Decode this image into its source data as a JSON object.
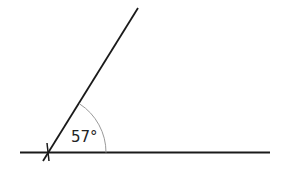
{
  "diagram": {
    "type": "angle",
    "angle_label": "57°",
    "angle_degrees": 57,
    "colors": {
      "line": "#1a1a1a",
      "arc": "#9a9a9a",
      "text": "#222222"
    }
  }
}
